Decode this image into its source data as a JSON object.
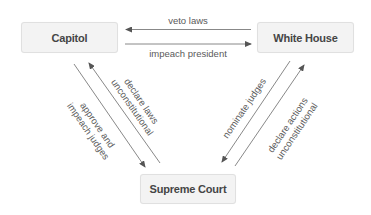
{
  "diagram": {
    "type": "checks-and-balances",
    "nodes": [
      {
        "id": "capitol",
        "label": "Capitol"
      },
      {
        "id": "white_house",
        "label": "White House"
      },
      {
        "id": "supreme_court",
        "label": "Supreme Court"
      }
    ],
    "edges": [
      {
        "from": "white_house",
        "to": "capitol",
        "label": "veto laws"
      },
      {
        "from": "capitol",
        "to": "white_house",
        "label": "impeach president"
      },
      {
        "from": "capitol",
        "to": "supreme_court",
        "label_line1": "approve and",
        "label_line2": "impeach judges"
      },
      {
        "from": "supreme_court",
        "to": "capitol",
        "label_line1": "declare laws",
        "label_line2": "unconstitutional"
      },
      {
        "from": "white_house",
        "to": "supreme_court",
        "label": "nominate judges"
      },
      {
        "from": "supreme_court",
        "to": "white_house",
        "label_line1": "declare actions",
        "label_line2": "unconstitutional"
      }
    ],
    "colors": {
      "node_fill": "#f3f3f3",
      "node_border": "#e0e0e0",
      "node_text": "#454545",
      "edge": "#6a6a6a",
      "edge_text": "#5a5a5a"
    }
  }
}
